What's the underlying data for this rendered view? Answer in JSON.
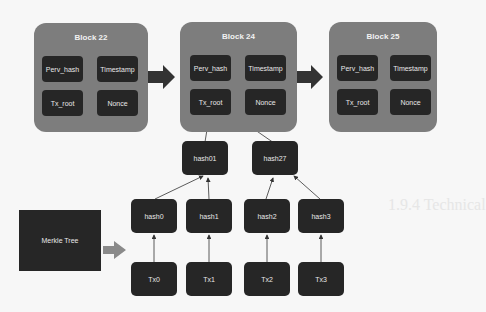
{
  "diagram": {
    "blocks": [
      {
        "title": "Block 22",
        "fields": [
          "Perv_hash",
          "Timestamp",
          "Tx_root",
          "Nonce"
        ]
      },
      {
        "title": "Block 24",
        "fields": [
          "Perv_hash",
          "Timestamp",
          "Tx_root",
          "Nonce"
        ]
      },
      {
        "title": "Block 25",
        "fields": [
          "Perv_hash",
          "Timestamp",
          "Tx_root",
          "Nonce"
        ]
      }
    ],
    "merkle_label": "Merkle Tree",
    "level1": [
      "hash01",
      "hash27"
    ],
    "level2": [
      "hash0",
      "hash1",
      "hash2",
      "hash3"
    ],
    "transactions": [
      "Tx0",
      "Tx1",
      "Tx2",
      "Tx3"
    ],
    "colors": {
      "block": "#7d7d7d",
      "node": "#262626",
      "arrow": "#333333",
      "merkle_arrow": "#8a8a8a"
    }
  },
  "background_text": {
    "heading": "1.9.4 Technical"
  }
}
